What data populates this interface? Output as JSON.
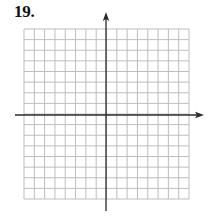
{
  "problem": {
    "number_label": "19."
  },
  "graph": {
    "type": "blank-coordinate-grid",
    "columns": 16,
    "rows": 16,
    "origin_column": 8,
    "origin_row": 8,
    "grid_left": 24,
    "grid_top": 29,
    "grid_right": 189,
    "grid_bottom": 199,
    "x_axis_y": 115,
    "y_axis_x": 106,
    "x_axis_start": 15,
    "x_axis_arrow_tip": 204,
    "y_axis_arrow_tip": 12,
    "y_axis_end": 211,
    "axis_labels": [],
    "tick_labels": [],
    "colors": {
      "grid_line": "#bdbdbd",
      "axis_line": "#2a2a2a",
      "background": "#ffffff"
    }
  }
}
